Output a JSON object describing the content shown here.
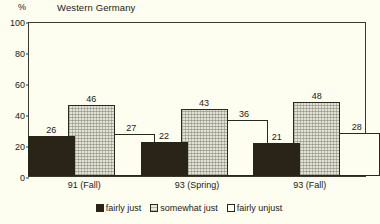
{
  "chart_data": {
    "type": "bar",
    "title": "Western Germany",
    "xlabel": "",
    "ylabel": "%",
    "ylim": [
      0,
      100
    ],
    "yticks": [
      0,
      20,
      40,
      60,
      80,
      100
    ],
    "grid": false,
    "legend_position": "bottom",
    "categories": [
      "91 (Fall)",
      "93 (Spring)",
      "93 (Fall)"
    ],
    "series": [
      {
        "name": "fairly just",
        "values": [
          26,
          22,
          21
        ]
      },
      {
        "name": "somewhat just",
        "values": [
          46,
          43,
          48
        ]
      },
      {
        "name": "fairly unjust",
        "values": [
          27,
          36,
          28
        ]
      }
    ],
    "colors": {
      "fairly just": "#2a2318",
      "somewhat just": "#e2e2d6",
      "fairly unjust": "#fdfdf0",
      "frame": "#3b382c",
      "background": "#fdfdf0"
    }
  }
}
